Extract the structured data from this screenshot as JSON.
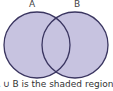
{
  "diagram": {
    "type": "venn",
    "sets": [
      {
        "label": "A",
        "cx": 37,
        "cy": 45,
        "r": 33
      },
      {
        "label": "B",
        "cx": 75,
        "cy": 45,
        "r": 33
      }
    ],
    "fill_color": "#c7c3e0",
    "stroke_color": "#3a3560",
    "caption": "A ∪ B is the shaded region"
  }
}
